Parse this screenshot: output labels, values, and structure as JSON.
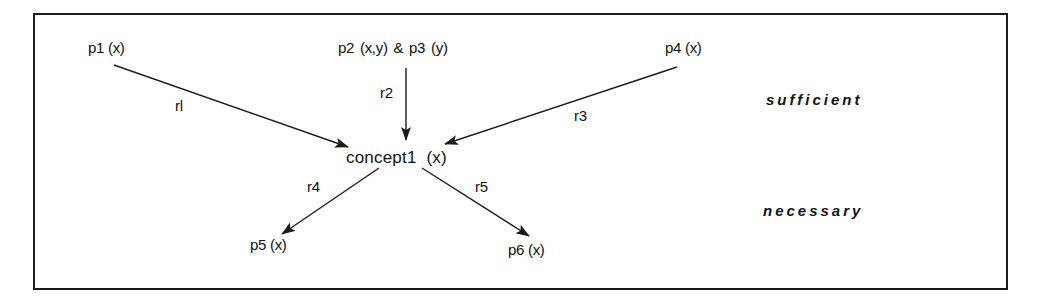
{
  "diagram": {
    "nodes": {
      "p1": "p1 (x)",
      "p2p3": "p2 (x,y)  &  p3 (y)",
      "p4": "p4 (x)",
      "concept": "concept1  (x)",
      "p5": "p5 (x)",
      "p6": "p6 (x)"
    },
    "edges": {
      "r1": "rl",
      "r2": "r2",
      "r3": "r3",
      "r4": "r4",
      "r5": "r5"
    },
    "categories": {
      "sufficient": "sufficient",
      "necessary": "necessary"
    },
    "colors": {
      "stroke": "#1a1a1a",
      "background": "#ffffff"
    }
  }
}
